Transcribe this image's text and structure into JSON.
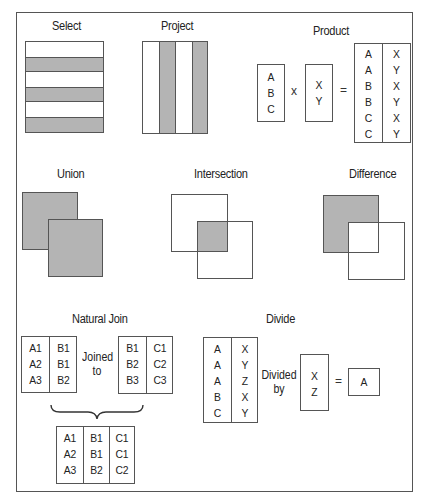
{
  "titles": {
    "select": "Select",
    "project": "Project",
    "product": "Product",
    "union": "Union",
    "intersection": "Intersection",
    "difference": "Difference",
    "natural_join": "Natural Join",
    "divide": "Divide"
  },
  "colors": {
    "shade": "#b4b4b4",
    "border": "#555555",
    "background": "#ffffff"
  },
  "select": {
    "rows": [
      "white",
      "gray",
      "white",
      "gray",
      "white",
      "gray"
    ]
  },
  "project": {
    "columns": [
      "white",
      "gray",
      "white",
      "gray"
    ]
  },
  "product": {
    "left": [
      "A",
      "B",
      "C"
    ],
    "times_symbol": "x",
    "right": [
      "X",
      "Y"
    ],
    "equals_symbol": "=",
    "result_col1": [
      "A",
      "A",
      "B",
      "B",
      "C",
      "C"
    ],
    "result_col2": [
      "X",
      "Y",
      "X",
      "Y",
      "X",
      "Y"
    ]
  },
  "natural_join": {
    "left_col1": [
      "A1",
      "A2",
      "A3"
    ],
    "left_col2": [
      "B1",
      "B1",
      "B2"
    ],
    "connector_line1": "Joined",
    "connector_line2": "to",
    "right_col1": [
      "B1",
      "B2",
      "B3"
    ],
    "right_col2": [
      "C1",
      "C2",
      "C3"
    ],
    "result_col1": [
      "A1",
      "A2",
      "A3"
    ],
    "result_col2": [
      "B1",
      "B1",
      "B2"
    ],
    "result_col3": [
      "C1",
      "C1",
      "C2"
    ]
  },
  "divide": {
    "left_col1": [
      "A",
      "A",
      "A",
      "B",
      "C"
    ],
    "left_col2": [
      "X",
      "Y",
      "Z",
      "X",
      "Y"
    ],
    "connector_line1": "Divided",
    "connector_line2": "by",
    "divisor": [
      "X",
      "Z"
    ],
    "equals_symbol": "=",
    "result": "A"
  }
}
